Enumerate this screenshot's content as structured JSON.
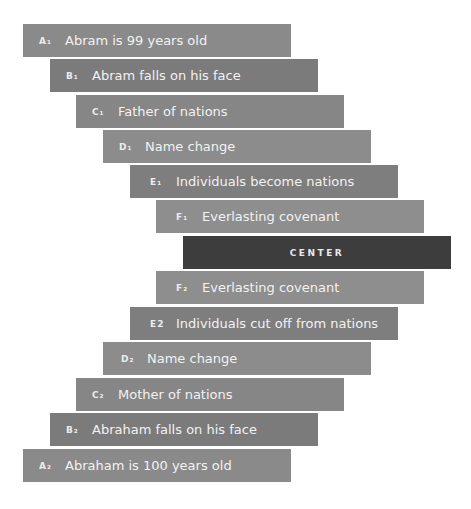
{
  "diagram": {
    "type": "chiasm",
    "rows": [
      {
        "label": "A₁",
        "text": "Abram is 99 years old",
        "color": "#8a8a8a"
      },
      {
        "label": "B₁",
        "text": "Abram falls on his face",
        "color": "#7b7b7b"
      },
      {
        "label": "C₁",
        "text": "Father of nations",
        "color": "#868686"
      },
      {
        "label": "D₁",
        "text": "Name change",
        "color": "#8c8c8c"
      },
      {
        "label": "E₁",
        "text": "Individuals become nations",
        "color": "#7e7e7e"
      },
      {
        "label": "F₁",
        "text": "Everlasting covenant",
        "color": "#8e8e8e"
      },
      {
        "label": "",
        "text": "CENTER",
        "color": "#3d3d3d"
      },
      {
        "label": "F₂",
        "text": "Everlasting covenant",
        "color": "#8e8e8e"
      },
      {
        "label": "E2",
        "text": "Individuals cut off from nations",
        "color": "#7e7e7e"
      },
      {
        "label": "D₂",
        "text": "Name change",
        "color": "#8c8c8c"
      },
      {
        "label": "C₂",
        "text": "Mother of nations",
        "color": "#868686"
      },
      {
        "label": "B₂",
        "text": "Abraham falls on his face",
        "color": "#7b7b7b"
      },
      {
        "label": "A₂",
        "text": "Abraham is 100 years old",
        "color": "#8a8a8a"
      }
    ]
  }
}
